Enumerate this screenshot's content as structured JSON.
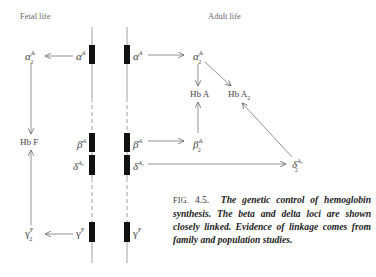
{
  "headings": {
    "fetal": "Fetal life",
    "adult": "Adult life"
  },
  "genes": {
    "alpha": {
      "base": "α",
      "sup": "A"
    },
    "beta": {
      "base": "β",
      "sup": "A"
    },
    "delta": {
      "base": "δ",
      "sup": "A₂"
    },
    "gamma": {
      "base": "γ",
      "sup": "F"
    }
  },
  "chains": {
    "alpha2": {
      "base": "α",
      "sub": "2",
      "sup": "A"
    },
    "gamma2": {
      "base": "γ",
      "sub": "2",
      "sup": "F"
    },
    "beta2": {
      "base": "β",
      "sub": "2",
      "sup": "A"
    },
    "delta2": {
      "base": "δ",
      "sub": "2",
      "sup": "A₂"
    }
  },
  "hemoglobins": {
    "hbF": "Hb F",
    "hbA": "Hb A",
    "hbA2_base": "Hb A",
    "hbA2_sub": "2"
  },
  "caption": {
    "fig_label": "FIG.",
    "fig_number": "4.5.",
    "text": "The genetic control of hemoglobin synthesis. The beta and delta loci are shown closely linked. Evidence of linkage comes from family and population studies."
  },
  "colors": {
    "gene_bar": "#111111",
    "line": "#777777",
    "text": "#444444"
  }
}
